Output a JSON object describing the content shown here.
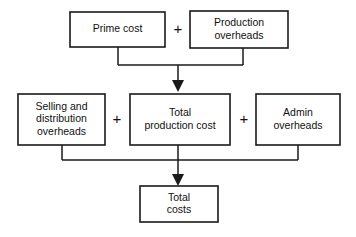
{
  "diagram": {
    "background_color": "#ffffff",
    "line_color": "#1a1a1a",
    "text_color": "#111111",
    "boxes": [
      {
        "id": "prime-cost",
        "lines": [
          "Prime cost"
        ],
        "x": 70,
        "y": 12,
        "w": 95,
        "h": 35
      },
      {
        "id": "production-overheads",
        "lines": [
          "Production",
          "overheads"
        ],
        "x": 190,
        "y": 11,
        "w": 98,
        "h": 37
      },
      {
        "id": "selling-and-distribution-overheads",
        "lines": [
          "Selling and",
          "distribution",
          "overheads"
        ],
        "x": 18,
        "y": 94,
        "w": 87,
        "h": 51
      },
      {
        "id": "total-production-cost",
        "lines": [
          "Total",
          "production cost"
        ],
        "x": 130,
        "y": 94,
        "w": 100,
        "h": 51
      },
      {
        "id": "admin-overheads",
        "lines": [
          "Admin",
          "overheads"
        ],
        "x": 256,
        "y": 94,
        "w": 84,
        "h": 51
      },
      {
        "id": "total-costs",
        "lines": [
          "Total",
          "costs"
        ],
        "x": 140,
        "y": 186,
        "w": 78,
        "h": 36
      }
    ],
    "operators": [
      {
        "id": "plus-top",
        "symbol": "+",
        "x": 178,
        "y": 30
      },
      {
        "id": "plus-left",
        "symbol": "+",
        "x": 117,
        "y": 120
      },
      {
        "id": "plus-right",
        "symbol": "+",
        "x": 244,
        "y": 120
      }
    ],
    "connectors": [
      {
        "id": "prime-cost-drop",
        "d": "M 118 47 L 118 65"
      },
      {
        "id": "production-overheads-drop",
        "d": "M 243 48 L 243 65"
      },
      {
        "id": "upper-bus-bar",
        "d": "M 118 65 L 243 65"
      },
      {
        "id": "upper-arrow-stem",
        "d": "M 178 65 L 178 86"
      },
      {
        "id": "selling-drop",
        "d": "M 62 145 L 62 160"
      },
      {
        "id": "selling-bus",
        "d": "M 62 160 L 178 160"
      },
      {
        "id": "admin-drop",
        "d": "M 298 145 L 298 160"
      },
      {
        "id": "admin-bus",
        "d": "M 178 160 L 298 160"
      },
      {
        "id": "total-production-drop",
        "d": "M 178 145 L 178 160"
      },
      {
        "id": "lower-arrow-stem",
        "d": "M 178 160 L 178 180"
      }
    ],
    "arrows": [
      {
        "id": "arrow-to-total-production-cost",
        "points": "172,80 184,80 178,92"
      },
      {
        "id": "arrow-to-total-costs",
        "points": "172,174 184,174 178,186"
      }
    ]
  }
}
